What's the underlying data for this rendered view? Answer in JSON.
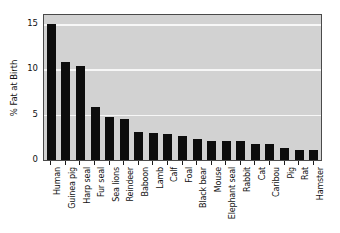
{
  "chart_data": {
    "type": "bar",
    "title": "",
    "xlabel": "",
    "ylabel": "% Fat at Birth",
    "ylim": [
      0,
      16
    ],
    "yticks": [
      0,
      5,
      10,
      15
    ],
    "ytick_labels": [
      "0",
      "5",
      "10",
      "15"
    ],
    "gridlines": [
      5,
      10,
      15
    ],
    "grid": true,
    "legend": "none",
    "bar_color": "#0d0d0d",
    "plot_background": "#d2d2d2",
    "grid_color": "#f7f7f7",
    "frame_color": "#4a4a4a",
    "categories": [
      "Human",
      "Guinea pig",
      "Harp seal",
      "Fur seal",
      "Sea lions",
      "Reindeer",
      "Baboon",
      "Lamb",
      "Calf",
      "Foal",
      "Black bear",
      "Mouse",
      "Elephant seal",
      "Rabbit",
      "Cat",
      "Caribou",
      "Pig",
      "Rat",
      "Hamster"
    ],
    "values": [
      15.0,
      10.8,
      10.4,
      5.9,
      4.8,
      4.55,
      3.1,
      3.0,
      2.85,
      2.6,
      2.35,
      2.1,
      2.1,
      2.1,
      1.8,
      1.78,
      1.3,
      1.1,
      1.1
    ]
  }
}
